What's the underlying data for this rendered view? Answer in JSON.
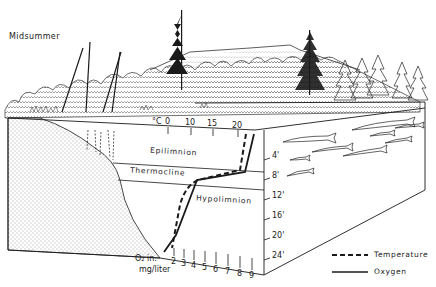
{
  "title": "Midsummer",
  "temperature_axis": {
    "unit_label": "°C",
    "ticks": [
      "0",
      "10",
      "15",
      "20"
    ]
  },
  "oxygen_axis": {
    "unit_label_line1": "O₂ in.",
    "unit_label_line2": "mg/liter",
    "ticks": [
      "2",
      "3",
      "4",
      "5",
      "6",
      "7",
      "8",
      "9"
    ]
  },
  "depth_axis": {
    "ticks": [
      "4'",
      "8'",
      "12'",
      "16'",
      "20'",
      "24'"
    ]
  },
  "layers": {
    "epilimnion": "Epilimnion",
    "thermocline": "Thermocline",
    "hypolimnion": "Hypolimnion"
  },
  "legend": {
    "temperature": "Temperature",
    "oxygen": "Oxygen"
  },
  "colors": {
    "ink": "#1a1a1a",
    "background": "#ffffff"
  }
}
